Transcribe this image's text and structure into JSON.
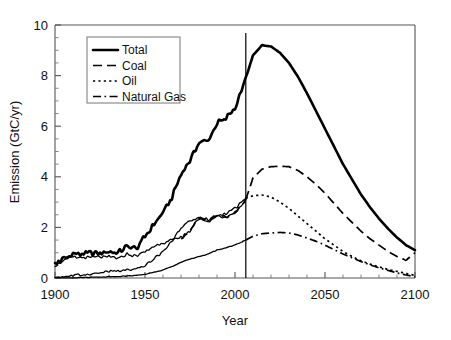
{
  "chart_data": {
    "type": "line",
    "title": "",
    "xlabel": "Year",
    "ylabel": "Emission (GtC/yr)",
    "xlim": [
      1900,
      2100
    ],
    "ylim": [
      0,
      10
    ],
    "xticks": [
      1900,
      1950,
      2000,
      2050,
      2100
    ],
    "yticks": [
      0,
      2,
      4,
      6,
      8,
      10
    ],
    "x_minor_step": 10,
    "y_minor_step": 0.5,
    "grid": false,
    "legend_position": "top-left",
    "annotations": [
      {
        "name": "present-day-marker",
        "type": "vline",
        "x": 2006,
        "label": ""
      }
    ],
    "x": [
      1900,
      1905,
      1910,
      1915,
      1920,
      1925,
      1930,
      1935,
      1940,
      1945,
      1950,
      1955,
      1960,
      1965,
      1970,
      1975,
      1980,
      1985,
      1990,
      1995,
      2000,
      2006,
      2010,
      2015,
      2020,
      2025,
      2030,
      2035,
      2040,
      2045,
      2050,
      2055,
      2060,
      2065,
      2070,
      2075,
      2080,
      2085,
      2090,
      2095,
      2100
    ],
    "series": [
      {
        "name": "Total",
        "style": "solid-thick",
        "values": [
          0.55,
          0.78,
          0.93,
          0.93,
          0.98,
          1.0,
          1.05,
          1.0,
          1.25,
          1.15,
          1.65,
          2.1,
          2.6,
          3.2,
          4.1,
          4.65,
          5.35,
          5.4,
          6.1,
          6.3,
          6.7,
          7.9,
          8.8,
          9.2,
          9.15,
          8.9,
          8.5,
          7.95,
          7.3,
          6.6,
          5.9,
          5.2,
          4.5,
          3.9,
          3.3,
          2.8,
          2.35,
          1.95,
          1.6,
          1.3,
          1.1
        ],
        "peak": {
          "x": 2015,
          "y": 9.2
        }
      },
      {
        "name": "Coal",
        "style": "long-dash",
        "values": [
          0.5,
          0.7,
          0.82,
          0.8,
          0.82,
          0.83,
          0.83,
          0.78,
          0.95,
          0.85,
          1.05,
          1.25,
          1.4,
          1.5,
          1.6,
          1.85,
          2.35,
          2.3,
          2.45,
          2.4,
          2.55,
          3.1,
          3.95,
          4.3,
          4.4,
          4.42,
          4.4,
          4.25,
          4.0,
          3.7,
          3.35,
          2.95,
          2.55,
          2.2,
          1.85,
          1.55,
          1.3,
          1.05,
          0.85,
          0.7,
          1.0
        ],
        "peak": {
          "x": 2028,
          "y": 4.45
        }
      },
      {
        "name": "Oil",
        "style": "dotted",
        "values": [
          0.04,
          0.07,
          0.1,
          0.12,
          0.16,
          0.2,
          0.26,
          0.27,
          0.32,
          0.33,
          0.5,
          0.75,
          1.05,
          1.45,
          2.0,
          2.25,
          2.4,
          2.2,
          2.45,
          2.55,
          2.75,
          3.15,
          3.25,
          3.28,
          3.2,
          3.0,
          2.75,
          2.45,
          2.15,
          1.85,
          1.55,
          1.3,
          1.05,
          0.85,
          0.68,
          0.55,
          0.44,
          0.34,
          0.26,
          0.18,
          0.1
        ],
        "peak": {
          "x": 2012,
          "y": 3.3
        }
      },
      {
        "name": "Natural Gas",
        "style": "dash-dot",
        "values": [
          0.0,
          0.01,
          0.01,
          0.02,
          0.03,
          0.04,
          0.05,
          0.06,
          0.08,
          0.1,
          0.15,
          0.22,
          0.32,
          0.45,
          0.62,
          0.75,
          0.85,
          0.95,
          1.1,
          1.2,
          1.3,
          1.5,
          1.65,
          1.75,
          1.78,
          1.8,
          1.78,
          1.7,
          1.58,
          1.45,
          1.3,
          1.12,
          0.95,
          0.8,
          0.65,
          0.52,
          0.4,
          0.3,
          0.2,
          0.12,
          0.05
        ],
        "peak": {
          "x": 2027,
          "y": 1.8
        }
      }
    ]
  },
  "legend": {
    "entries": [
      {
        "label": "Total",
        "style": "solid-thick"
      },
      {
        "label": "Coal",
        "style": "long-dash"
      },
      {
        "label": "Oil",
        "style": "dotted"
      },
      {
        "label": "Natural Gas",
        "style": "dash-dot"
      }
    ]
  },
  "axes": {
    "x_title": "Year",
    "y_title": "Emission (GtC/yr)",
    "x_tick_labels": [
      "1900",
      "1950",
      "2000",
      "2050",
      "2100"
    ],
    "y_tick_labels": [
      "0",
      "2",
      "4",
      "6",
      "8",
      "10"
    ]
  }
}
